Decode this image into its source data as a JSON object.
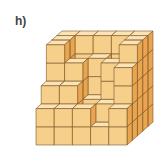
{
  "figure": {
    "label": "h)",
    "colors": {
      "front": "#f6cf8b",
      "top": "#fbe3b6",
      "side": "#e9a550",
      "edge": "#7a5526"
    },
    "grid": {
      "width": 5,
      "height": 5,
      "depth": 5
    },
    "heights": [
      [
        5,
        5,
        5,
        5,
        5
      ],
      [
        5,
        3,
        4,
        3,
        5
      ],
      [
        5,
        4,
        2,
        4,
        5
      ],
      [
        3,
        3,
        1,
        2,
        4
      ],
      [
        2,
        2,
        2,
        1,
        2
      ]
    ]
  }
}
